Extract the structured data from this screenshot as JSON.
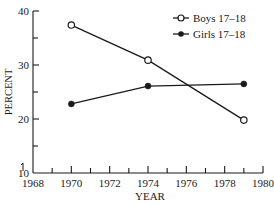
{
  "chart_data": {
    "type": "line",
    "title": "",
    "xlabel": "YEAR",
    "ylabel": "PERCENT",
    "xlim": [
      1968,
      1980
    ],
    "ylim": [
      10,
      40
    ],
    "x_ticks": [
      1968,
      1970,
      1972,
      1974,
      1976,
      1978,
      1980
    ],
    "x_minor_ticks": [
      1969,
      1971,
      1973,
      1975,
      1977,
      1979
    ],
    "y_ticks": [
      10,
      20,
      30,
      40
    ],
    "y_minor_ticks": [
      15,
      25,
      35
    ],
    "grid": false,
    "legend_position": "upper right",
    "series": [
      {
        "name": "Boys 17–18",
        "marker": "open-circle",
        "x": [
          1970,
          1974,
          1979
        ],
        "values": [
          37.4,
          30.9,
          19.8
        ]
      },
      {
        "name": "Girls 17–18",
        "marker": "filled-circle",
        "x": [
          1970,
          1974,
          1979
        ],
        "values": [
          22.8,
          26.1,
          26.5
        ]
      }
    ]
  },
  "colors": {
    "ink": "#1a1a1a",
    "background": "#ffffff"
  }
}
